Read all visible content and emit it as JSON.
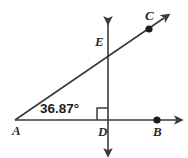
{
  "figure": {
    "background_color": "#ffffff",
    "stroke_color": "#3a3a3a",
    "label_color": "#2b2b2b",
    "angle_text_color": "#1c1c1c"
  },
  "angle": {
    "value": "36.87°",
    "vertex": "A",
    "right_angle_marker": true
  },
  "points": [
    {
      "id": "A",
      "label": "A",
      "x": 15,
      "y": 120,
      "label_x": 12,
      "label_y": 135,
      "dot": false
    },
    {
      "id": "B",
      "label": "B",
      "x": 157,
      "y": 120,
      "label_x": 153,
      "label_y": 136,
      "dot": true
    },
    {
      "id": "C",
      "label": "C",
      "x": 149,
      "y": 29,
      "label_x": 145,
      "label_y": 20,
      "dot": true
    },
    {
      "id": "D",
      "label": "D",
      "x": 108,
      "y": 120,
      "label_x": 98,
      "label_y": 136,
      "dot": false
    },
    {
      "id": "E",
      "label": "E",
      "x": 108,
      "y": 47,
      "label_x": 95,
      "label_y": 46,
      "dot": false
    }
  ],
  "lines": [
    {
      "name": "ray-AC",
      "from": "A",
      "to": "C",
      "arrow_end": true,
      "arrow_start": false
    },
    {
      "name": "ray-AB",
      "from": "A",
      "to": "B",
      "arrow_end": true,
      "arrow_start": false
    },
    {
      "name": "vertical-line-D",
      "from": "D",
      "to": "D",
      "arrow_end": true,
      "arrow_start": true
    }
  ]
}
